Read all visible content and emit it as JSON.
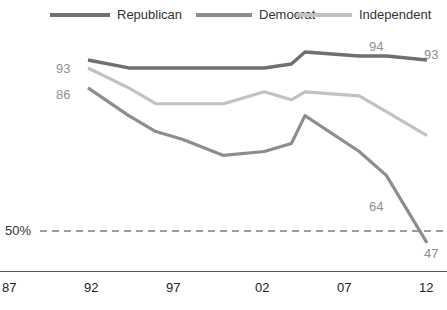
{
  "chart_data": {
    "type": "line",
    "title": "",
    "subtitle": "",
    "xlabel": "",
    "ylabel": "",
    "grid": false,
    "legend_position": "top",
    "x": [
      "87",
      "92",
      "97",
      "02",
      "07",
      "12"
    ],
    "x_tick_labels": [
      "87",
      "92",
      "97",
      "02",
      "07",
      "12"
    ],
    "xlim": [
      1987,
      2012
    ],
    "ylim": [
      40,
      100
    ],
    "reference_line": {
      "value": 50,
      "label": "50%",
      "style": "dashed"
    },
    "series": [
      {
        "name": "Republican",
        "color": "#6f6f6f",
        "x": [
          1987,
          1990,
          1992,
          1994,
          1997,
          2000,
          2002,
          2003,
          2007,
          2009,
          2012
        ],
        "values": [
          93,
          91,
          91,
          91,
          91,
          91,
          92,
          95,
          94,
          94,
          93
        ],
        "point_labels": {
          "1987": 93,
          "2009": 94,
          "2012": 93
        }
      },
      {
        "name": "Democrat",
        "color": "#8d8d8d",
        "x": [
          1987,
          1990,
          1992,
          1994,
          1997,
          2000,
          2002,
          2003,
          2007,
          2009,
          2012
        ],
        "values": [
          86,
          79,
          75,
          73,
          69,
          70,
          72,
          79,
          70,
          64,
          47
        ],
        "point_labels": {
          "1987": 86,
          "2009": 64,
          "2012": 47
        }
      },
      {
        "name": "Independent",
        "color": "#c2c2c2",
        "x": [
          1987,
          1990,
          1992,
          1994,
          1997,
          2000,
          2002,
          2003,
          2007,
          2009,
          2012
        ],
        "values": [
          91,
          86,
          82,
          82,
          82,
          85,
          83,
          85,
          84,
          80,
          74
        ],
        "point_labels": {}
      }
    ],
    "annotations": [
      {
        "id": "93-left",
        "text": "93",
        "series": "Republican",
        "x": 1987,
        "y": 93
      },
      {
        "id": "86-left",
        "text": "86",
        "series": "Democrat",
        "x": 1987,
        "y": 86
      },
      {
        "id": "94-right",
        "text": "94",
        "series": "Republican",
        "x": 2009,
        "y": 94
      },
      {
        "id": "93-right",
        "text": "93",
        "series": "Republican",
        "x": 2012,
        "y": 93
      },
      {
        "id": "64-right",
        "text": "64",
        "series": "Democrat",
        "x": 2009,
        "y": 64
      },
      {
        "id": "47-right",
        "text": "47",
        "series": "Democrat",
        "x": 2012,
        "y": 47
      }
    ]
  },
  "legend": {
    "items": [
      {
        "label": "Republican",
        "color": "#6f6f6f"
      },
      {
        "label": "Democrat",
        "color": "#8d8d8d"
      },
      {
        "label": "Independent",
        "color": "#c2c2c2"
      }
    ]
  },
  "axis": {
    "reference_label": "50%",
    "x_ticks": [
      "87",
      "92",
      "97",
      "02",
      "07",
      "12"
    ]
  },
  "labels": {
    "rep_start": "93",
    "dem_start": "86",
    "rep_2009": "94",
    "rep_2012": "93",
    "dem_2009": "64",
    "dem_2012": "47"
  },
  "colors": {
    "republican": "#6f6f6f",
    "democrat": "#8d8d8d",
    "independent": "#c2c2c2",
    "axis": "#555555",
    "label_text": "#8f8f8f",
    "tick_text": "#222222",
    "background": "#ffffff"
  }
}
